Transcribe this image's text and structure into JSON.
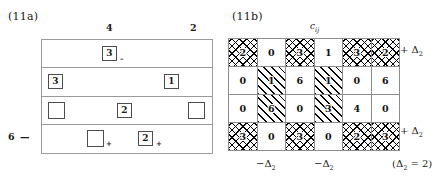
{
  "figure": {
    "panel_a": {
      "label": "(11a)",
      "column_headers": [
        {
          "text": "4"
        },
        {
          "text": "2"
        }
      ],
      "row_header": "6 —",
      "rows": [
        {
          "cells": [
            {
              "value": "3",
              "sign": "–",
              "style": "boxed"
            }
          ]
        },
        {
          "cells": [
            {
              "value": "3",
              "sign": "",
              "style": "boxed"
            },
            {
              "value": "1",
              "sign": "",
              "style": "boxed"
            }
          ]
        },
        {
          "cells": [
            {
              "value": "",
              "sign": "",
              "style": "empty"
            },
            {
              "value": "2",
              "sign": "",
              "style": "boxed"
            },
            {
              "value": "",
              "sign": "",
              "style": "empty"
            }
          ]
        },
        {
          "cells": [
            {
              "value": "",
              "sign": "+",
              "style": "empty"
            },
            {
              "value": "2",
              "sign": "+",
              "style": "boxed"
            }
          ]
        }
      ]
    },
    "panel_b": {
      "label": "(11b)",
      "matrix_title": "c",
      "matrix_title_sub": "ij",
      "matrix": {
        "rows": [
          [
            {
              "value": "2",
              "fill": "cross"
            },
            {
              "value": "0",
              "fill": "plain"
            },
            {
              "value": "3",
              "fill": "cross"
            },
            {
              "value": "1",
              "fill": "plain"
            },
            {
              "value": "3",
              "fill": "cross"
            },
            {
              "value": "2",
              "fill": "cross"
            }
          ],
          [
            {
              "value": "0",
              "fill": "plain"
            },
            {
              "value": "1",
              "fill": "diag"
            },
            {
              "value": "6",
              "fill": "plain"
            },
            {
              "value": "1",
              "fill": "diag"
            },
            {
              "value": "0",
              "fill": "plain"
            },
            {
              "value": "6",
              "fill": "plain"
            }
          ],
          [
            {
              "value": "0",
              "fill": "plain"
            },
            {
              "value": "6",
              "fill": "diag"
            },
            {
              "value": "0",
              "fill": "plain"
            },
            {
              "value": "3",
              "fill": "diag"
            },
            {
              "value": "4",
              "fill": "plain"
            },
            {
              "value": "0",
              "fill": "plain"
            }
          ],
          [
            {
              "value": "3",
              "fill": "cross"
            },
            {
              "value": "0",
              "fill": "plain"
            },
            {
              "value": "3",
              "fill": "cross"
            },
            {
              "value": "0",
              "fill": "plain"
            },
            {
              "value": "2",
              "fill": "cross"
            },
            {
              "value": "3",
              "fill": "cross"
            }
          ]
        ]
      },
      "side_notes": {
        "top": "+ Δ",
        "top_sub": "2",
        "bottom": "+ Δ",
        "bottom_sub": "2"
      },
      "bottom_notes": [
        {
          "text": "−Δ",
          "sub": "2"
        },
        {
          "text": "−Δ",
          "sub": "2"
        },
        {
          "text": "(Δ",
          "sub": "2",
          "tail": " = 2)"
        }
      ]
    }
  }
}
